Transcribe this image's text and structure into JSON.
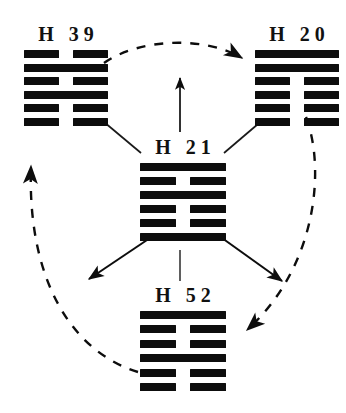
{
  "diagram": {
    "ink_color": "#0d0d0d",
    "background_color": "#ffffff",
    "center_node_id": "h21",
    "cycle_direction": "clockwise"
  },
  "hexagrams": [
    {
      "id": "h39",
      "prefix": "H",
      "number": "39",
      "label": "H  39",
      "position": "top-left",
      "lines_top_to_bottom": [
        "broken",
        "solid",
        "broken",
        "solid",
        "broken",
        "broken"
      ]
    },
    {
      "id": "h20",
      "prefix": "H",
      "number": "20",
      "label": "H  20",
      "position": "top-right",
      "lines_top_to_bottom": [
        "solid",
        "solid",
        "broken",
        "broken",
        "broken",
        "broken"
      ]
    },
    {
      "id": "h21",
      "prefix": "H",
      "number": "21",
      "label": "H  21",
      "position": "center",
      "lines_top_to_bottom": [
        "solid",
        "broken",
        "solid",
        "broken",
        "broken",
        "solid"
      ]
    },
    {
      "id": "h52",
      "prefix": "H",
      "number": "52",
      "label": "H  52",
      "position": "bottom-center",
      "lines_top_to_bottom": [
        "solid",
        "broken",
        "broken",
        "solid",
        "broken",
        "broken"
      ]
    }
  ],
  "connectors": {
    "solid_arrows": [
      {
        "id": "arrow-up",
        "from": "h21",
        "to": "h20_h39_between",
        "direction": "up"
      },
      {
        "id": "arrow-down-left",
        "from": "h21",
        "to": "lower-left",
        "direction": "down-left"
      },
      {
        "id": "arrow-down-right",
        "from": "h21",
        "to": "lower-right",
        "direction": "down-right"
      }
    ],
    "plain_lines": [
      {
        "id": "line-h39-center",
        "from": "h39",
        "to": "h21"
      },
      {
        "id": "line-h20-center",
        "from": "h20",
        "to": "h21"
      },
      {
        "id": "line-h21-h52",
        "from": "h21",
        "to": "h52"
      }
    ],
    "dashed_arcs": [
      {
        "id": "arc-h39-to-h20",
        "from": "h39",
        "to": "h20",
        "arrowhead": "at-h20"
      },
      {
        "id": "arc-h20-to-h52",
        "from": "h20",
        "to": "h52",
        "arrowhead": "at-h52"
      },
      {
        "id": "arc-h52-to-h39",
        "from": "h52",
        "to": "h39",
        "arrowhead": "at-h39"
      }
    ]
  }
}
